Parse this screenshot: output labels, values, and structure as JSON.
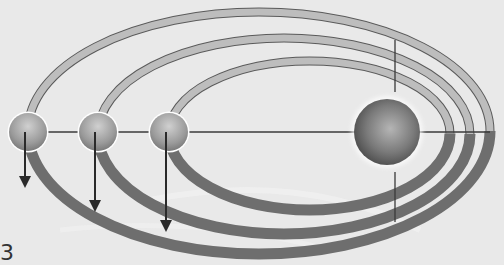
{
  "diagram": {
    "central_body": {
      "cx": 387,
      "cy": 132,
      "r": 33
    },
    "orbiting_bodies": [
      {
        "cx": 28,
        "cy": 132,
        "r": 19,
        "arrow_end_y": 188
      },
      {
        "cx": 98,
        "cy": 132,
        "r": 19,
        "arrow_end_y": 212
      },
      {
        "cx": 169,
        "cy": 132,
        "r": 19,
        "arrow_end_y": 232
      }
    ],
    "orbits": [
      {
        "left_x": 28,
        "right_x": 490,
        "top_y": 12,
        "bottom_y": 250,
        "focus_x": 387
      },
      {
        "left_x": 98,
        "right_x": 470,
        "top_y": 38,
        "bottom_y": 230,
        "focus_x": 387
      },
      {
        "left_x": 169,
        "right_x": 450,
        "top_y": 61,
        "bottom_y": 206,
        "focus_x": 387
      }
    ],
    "axis_line_y": 132,
    "vertical_marker_x": 395,
    "colors": {
      "background": "#e9e9e9",
      "orbit_band_light": "#bdbdbd",
      "orbit_band_dark": "#6e6e6e",
      "line": "#3a3a3a"
    }
  },
  "figure_label": "3"
}
